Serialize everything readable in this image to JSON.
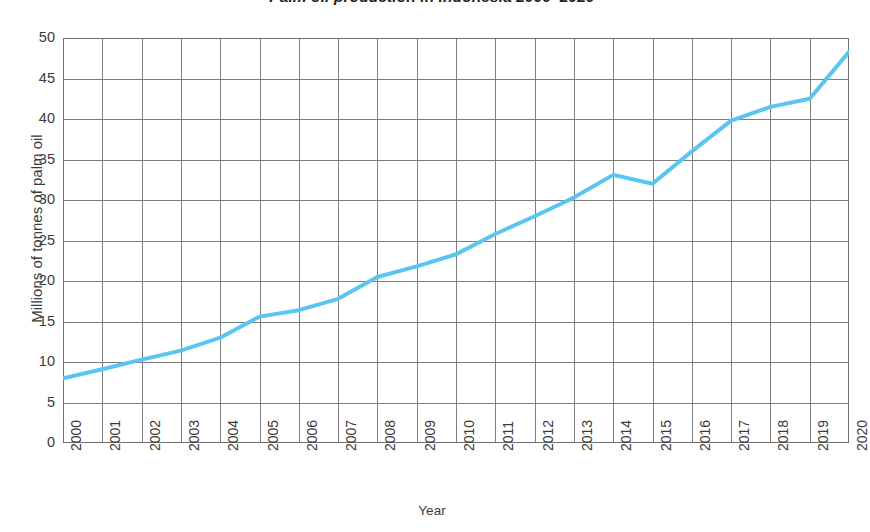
{
  "chart_data": {
    "type": "line",
    "title": "Palm oil production in Indonesia 2000–2020",
    "xlabel": "Year",
    "ylabel": "Millions of tonnes of palm oil",
    "x": [
      2000,
      2001,
      2002,
      2003,
      2004,
      2005,
      2006,
      2007,
      2008,
      2009,
      2010,
      2011,
      2012,
      2013,
      2014,
      2015,
      2016,
      2017,
      2018,
      2019,
      2020
    ],
    "categories": [
      "2000",
      "2001",
      "2002",
      "2003",
      "2004",
      "2005",
      "2006",
      "2007",
      "2008",
      "2009",
      "2010",
      "2011",
      "2012",
      "2013",
      "2014",
      "2015",
      "2016",
      "2017",
      "2018",
      "2019",
      "2020"
    ],
    "values": [
      8.0,
      9.1,
      10.3,
      11.4,
      13.0,
      15.6,
      16.4,
      17.8,
      20.5,
      21.8,
      23.3,
      25.8,
      28.0,
      30.3,
      33.1,
      32.0,
      36.0,
      39.8,
      41.5,
      42.5,
      48.3
    ],
    "series": [
      {
        "name": "Palm oil production",
        "values": [
          8.0,
          9.1,
          10.3,
          11.4,
          13.0,
          15.6,
          16.4,
          17.8,
          20.5,
          21.8,
          23.3,
          25.8,
          28.0,
          30.3,
          33.1,
          32.0,
          36.0,
          39.8,
          41.5,
          42.5,
          48.3
        ],
        "color": "#5bc5f2"
      }
    ],
    "xlim": [
      2000,
      2020
    ],
    "ylim": [
      0,
      50
    ],
    "y_ticks": [
      0,
      5,
      10,
      15,
      20,
      25,
      30,
      35,
      40,
      45,
      50
    ],
    "y_tick_labels": [
      "0",
      "5",
      "10",
      "15",
      "20",
      "25",
      "30",
      "35",
      "40",
      "45",
      "50"
    ],
    "grid": "both",
    "grid_color": "#7d7d7d",
    "legend": "none",
    "line_color": "#5bc5f2",
    "line_width": 4,
    "markers": "none",
    "background_color": "#ffffff"
  }
}
